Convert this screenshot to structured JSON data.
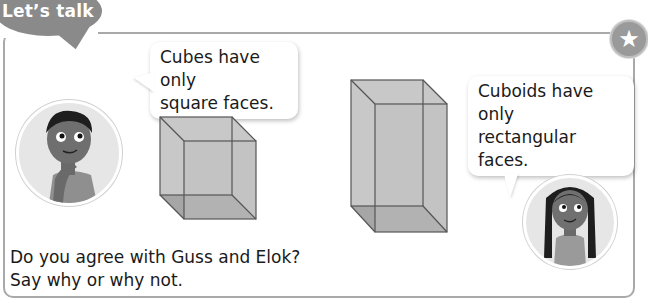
{
  "header": {
    "title": "Let’s talk",
    "badge_icon": "star-icon",
    "badge_glyph": "★"
  },
  "characters": [
    {
      "name": "Guss",
      "speech": [
        "Cubes have only",
        "square faces."
      ]
    },
    {
      "name": "Elok",
      "speech": [
        "Cuboids have only",
        "rectangular faces."
      ]
    }
  ],
  "shapes": [
    {
      "type": "cube",
      "label": ""
    },
    {
      "type": "cuboid",
      "label": ""
    }
  ],
  "question": {
    "line1": "Do you agree with Guss and Elok?",
    "line2": "Say why or why not."
  },
  "colors": {
    "title_bubble": "#8a8a8a",
    "frame_border": "#a9a9a9",
    "shape_fill": "#c4c4c4",
    "shape_edge": "#555555"
  }
}
